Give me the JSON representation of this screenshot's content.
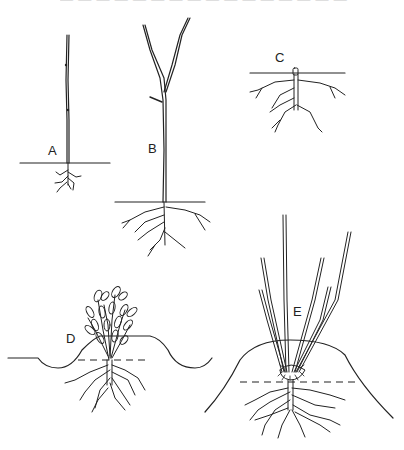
{
  "caption_fragment": "— — — — — — — — — — — — — — — —",
  "figures": [
    {
      "id": "A",
      "label": "A",
      "description": "Young unbranched whip seedling with small fibrous roots below the soil line"
    },
    {
      "id": "B",
      "label": "B",
      "description": "Taller seedling forked near the top with spreading root system below the soil line"
    },
    {
      "id": "C",
      "label": "C",
      "description": "Stem cut back to soil level, roots remaining below ground"
    },
    {
      "id": "D",
      "label": "D",
      "description": "Leafy shoots emerging from cut stump, soil mounded around base; dashed line marks original soil level"
    },
    {
      "id": "E",
      "label": "E",
      "description": "Long straight shoots rising from a high soil mound; new roots formed at base of shoots above dashed original soil level"
    }
  ],
  "colors": {
    "ink": "#222222",
    "background": "#ffffff"
  }
}
